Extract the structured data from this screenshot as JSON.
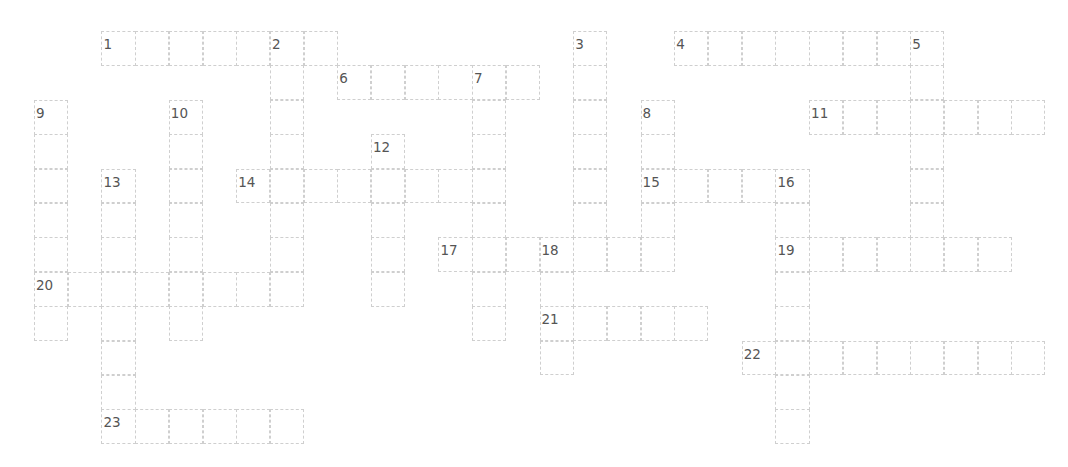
{
  "puzzle": {
    "type": "crossword",
    "entries": [
      {
        "number": "1",
        "direction": "across",
        "col": 2,
        "row": 0,
        "length": 7
      },
      {
        "number": "2",
        "direction": "down",
        "col": 7,
        "row": 0,
        "length": 8
      },
      {
        "number": "3",
        "direction": "down",
        "col": 16,
        "row": 0,
        "length": 7
      },
      {
        "number": "4",
        "direction": "across",
        "col": 19,
        "row": 0,
        "length": 8
      },
      {
        "number": "5",
        "direction": "down",
        "col": 26,
        "row": 0,
        "length": 7
      },
      {
        "number": "6",
        "direction": "across",
        "col": 9,
        "row": 1,
        "length": 6
      },
      {
        "number": "7",
        "direction": "down",
        "col": 13,
        "row": 1,
        "length": 8
      },
      {
        "number": "8",
        "direction": "down",
        "col": 18,
        "row": 2,
        "length": 5
      },
      {
        "number": "9",
        "direction": "down",
        "col": 0,
        "row": 2,
        "length": 7
      },
      {
        "number": "10",
        "direction": "down",
        "col": 4,
        "row": 2,
        "length": 7
      },
      {
        "number": "11",
        "direction": "across",
        "col": 23,
        "row": 2,
        "length": 7
      },
      {
        "number": "12",
        "direction": "down",
        "col": 10,
        "row": 3,
        "length": 5
      },
      {
        "number": "13",
        "direction": "down",
        "col": 2,
        "row": 4,
        "length": 8
      },
      {
        "number": "14",
        "direction": "across",
        "col": 6,
        "row": 4,
        "length": 8
      },
      {
        "number": "15",
        "direction": "across",
        "col": 18,
        "row": 4,
        "length": 5
      },
      {
        "number": "16",
        "direction": "down",
        "col": 22,
        "row": 4,
        "length": 8
      },
      {
        "number": "17",
        "direction": "across",
        "col": 12,
        "row": 6,
        "length": 7
      },
      {
        "number": "18",
        "direction": "down",
        "col": 15,
        "row": 6,
        "length": 4
      },
      {
        "number": "19",
        "direction": "across",
        "col": 22,
        "row": 6,
        "length": 7
      },
      {
        "number": "20",
        "direction": "across",
        "col": 0,
        "row": 7,
        "length": 8
      },
      {
        "number": "21",
        "direction": "across",
        "col": 15,
        "row": 8,
        "length": 5
      },
      {
        "number": "22",
        "direction": "across",
        "col": 21,
        "row": 9,
        "length": 9
      },
      {
        "number": "23",
        "direction": "across",
        "col": 2,
        "row": 11,
        "length": 6
      }
    ],
    "cell_values": {}
  },
  "colors": {
    "grid_line": "#cfcfcf",
    "number_text": "#555555",
    "background": "#ffffff"
  }
}
